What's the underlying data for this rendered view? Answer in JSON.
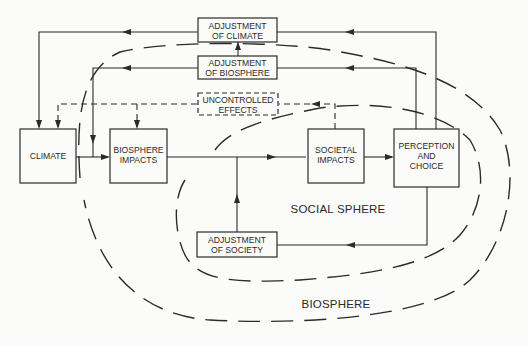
{
  "diagram": {
    "nodes": {
      "climate": {
        "label_lines": [
          "CLIMATE"
        ]
      },
      "biosphere_impacts": {
        "label_lines": [
          "BIOSPHERE",
          "IMPACTS"
        ]
      },
      "societal_impacts": {
        "label_lines": [
          "SOCIETAL",
          "IMPACTS"
        ]
      },
      "perception_choice": {
        "label_lines": [
          "PERCEPTION",
          "AND",
          "CHOICE"
        ]
      },
      "adjustment_climate": {
        "label_lines": [
          "ADJUSTMENT",
          "OF CLIMATE"
        ]
      },
      "adjustment_biosphere": {
        "label_lines": [
          "ADJUSTMENT",
          "OF BIOSPHERE"
        ]
      },
      "uncontrolled_effects": {
        "label_lines": [
          "UNCONTROLLED",
          "EFFECTS"
        ],
        "style": "dashed"
      },
      "adjustment_society": {
        "label_lines": [
          "ADJUSTMENT",
          "OF SOCIETY"
        ]
      }
    },
    "regions": {
      "social_sphere": "SOCIAL SPHERE",
      "biosphere": "BIOSPHERE"
    },
    "edges": [
      {
        "from": "climate",
        "to": "biosphere_impacts",
        "style": "solid"
      },
      {
        "from": "biosphere_impacts",
        "to": "societal_impacts",
        "style": "solid"
      },
      {
        "from": "societal_impacts",
        "to": "perception_choice",
        "style": "solid"
      },
      {
        "from": "perception_choice",
        "to": "adjustment_climate",
        "style": "solid"
      },
      {
        "from": "adjustment_climate",
        "to": "climate",
        "style": "solid"
      },
      {
        "from": "perception_choice",
        "to": "adjustment_biosphere",
        "style": "solid"
      },
      {
        "from": "adjustment_biosphere",
        "to": "adjustment_climate",
        "style": "solid"
      },
      {
        "from": "adjustment_biosphere",
        "to": "biosphere_impacts",
        "style": "solid"
      },
      {
        "from": "societal_impacts",
        "to": "uncontrolled_effects",
        "style": "dashed"
      },
      {
        "from": "uncontrolled_effects",
        "to": "climate",
        "style": "dashed"
      },
      {
        "from": "uncontrolled_effects",
        "to": "biosphere_impacts",
        "style": "dashed"
      },
      {
        "from": "perception_choice",
        "to": "adjustment_society",
        "style": "solid"
      },
      {
        "from": "adjustment_society",
        "to": "societal_impacts",
        "style": "solid"
      }
    ]
  }
}
